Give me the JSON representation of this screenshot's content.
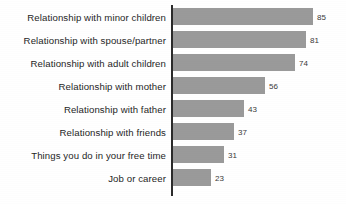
{
  "chart_data": {
    "type": "bar",
    "orientation": "horizontal",
    "title": "",
    "subtitle": "",
    "xlabel": "",
    "ylabel": "",
    "grid": false,
    "legend": null,
    "axis": {
      "show_value_axis_line": true,
      "xlim": [
        0,
        85
      ]
    },
    "max_value": 85,
    "categories": [
      "Relationship with minor children",
      "Relationship with spouse/partner",
      "Relationship with adult children",
      "Relationship with mother",
      "Relationship with father",
      "Relationship with friends",
      "Things you do in your free time",
      "Job or career"
    ],
    "values": [
      85,
      81,
      74,
      56,
      43,
      37,
      31,
      23
    ],
    "value_labels": [
      "85",
      "81",
      "74",
      "56",
      "43",
      "37",
      "31",
      "23"
    ],
    "colors": {
      "bar": "#9a9a9a",
      "axis": "#2b2b2b",
      "label_text": "#262626",
      "value_text": "#3a3a3a",
      "background": "#ffffff"
    },
    "bars": [
      {
        "label": "Relationship with minor children",
        "value": 85,
        "value_label": "85"
      },
      {
        "label": "Relationship with spouse/partner",
        "value": 81,
        "value_label": "81"
      },
      {
        "label": "Relationship with adult children",
        "value": 74,
        "value_label": "74"
      },
      {
        "label": "Relationship with mother",
        "value": 56,
        "value_label": "56"
      },
      {
        "label": "Relationship with father",
        "value": 43,
        "value_label": "43"
      },
      {
        "label": "Relationship with friends",
        "value": 37,
        "value_label": "37"
      },
      {
        "label": "Things you do in your free time",
        "value": 31,
        "value_label": "31"
      },
      {
        "label": "Job or career",
        "value": 23,
        "value_label": "23"
      }
    ]
  }
}
